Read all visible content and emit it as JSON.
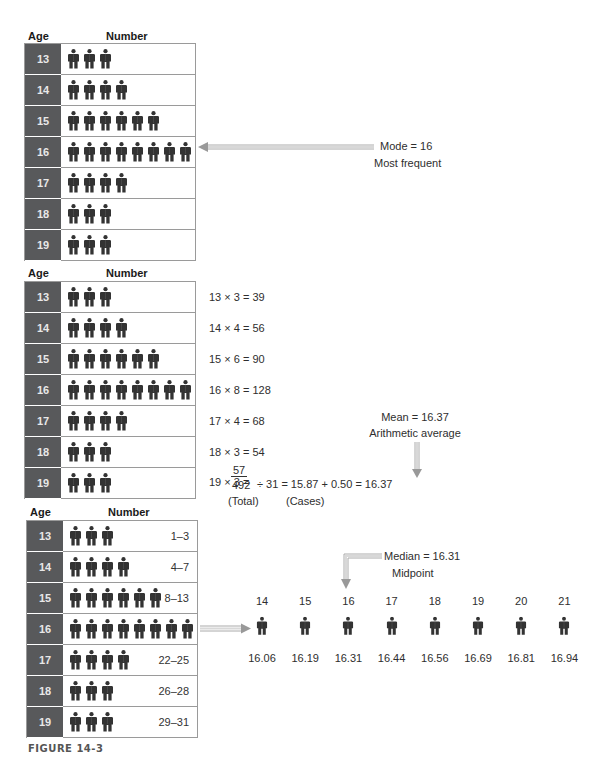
{
  "headers": {
    "age": "Age",
    "number": "Number"
  },
  "rows": [
    {
      "age": "13",
      "count": 3,
      "range": "1–3",
      "product": "13 × 3 = 39"
    },
    {
      "age": "14",
      "count": 4,
      "range": "4–7",
      "product": "14 × 4 = 56"
    },
    {
      "age": "15",
      "count": 6,
      "range": "8–13",
      "product": "15 × 6 = 90"
    },
    {
      "age": "16",
      "count": 8,
      "range": "",
      "product": "16 × 8 = 128"
    },
    {
      "age": "17",
      "count": 4,
      "range": "22–25",
      "product": "17 × 4 = 68"
    },
    {
      "age": "18",
      "count": 3,
      "range": "26–28",
      "product": "18 × 3 = 54"
    },
    {
      "age": "19",
      "count": 3,
      "range": "29–31",
      "product": "19 × 3 ="
    }
  ],
  "mode": {
    "label": "Mode  =  16",
    "sub": "Most frequent"
  },
  "mean": {
    "label": "Mean  =  16.37",
    "sub": "Arithmetic average",
    "last_product": "57",
    "total": "492",
    "division": "÷   31  =   15.87 + 0.50 = 16.37",
    "total_label": "(Total)",
    "cases_label": "(Cases)"
  },
  "median": {
    "label": "Median  =  16.31",
    "sub": "Midpoint",
    "line": [
      {
        "pos": "14",
        "value": "16.06"
      },
      {
        "pos": "15",
        "value": "16.19"
      },
      {
        "pos": "16",
        "value": "16.31"
      },
      {
        "pos": "17",
        "value": "16.44"
      },
      {
        "pos": "18",
        "value": "16.56"
      },
      {
        "pos": "19",
        "value": "16.69"
      },
      {
        "pos": "20",
        "value": "16.81"
      },
      {
        "pos": "21",
        "value": "16.94"
      }
    ]
  },
  "caption": "FIGURE 14-3",
  "colors": {
    "age_cell": "#58595b",
    "figure": "#333333",
    "border": "#9a9a9a"
  }
}
